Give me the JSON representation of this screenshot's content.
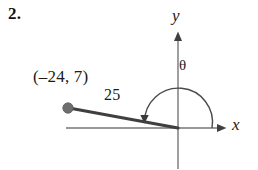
{
  "problem": {
    "number": "2."
  },
  "figure": {
    "type": "coordinate-plane-angle-diagram",
    "labels": {
      "point": "(–24, 7)",
      "radius": "25",
      "angle": "θ",
      "y_axis": "y",
      "x_axis": "x"
    },
    "colors": {
      "axis": "#6f6f6f",
      "ray": "#3a3a3a",
      "arc": "#4a4a4a",
      "point_marker": "#6b6b6b",
      "text": "#1b1b1b",
      "background": "#ffffff"
    },
    "geometry": {
      "origin": [
        178,
        128
      ],
      "point": [
        68,
        108
      ],
      "x_axis_from": [
        66,
        128
      ],
      "x_axis_to": [
        224,
        128
      ],
      "y_axis_from": [
        178,
        34
      ],
      "y_axis_to": [
        178,
        170
      ],
      "arc_radius": 34,
      "arc_start_angle_deg": 0,
      "arc_end_angle_deg": 170
    }
  }
}
